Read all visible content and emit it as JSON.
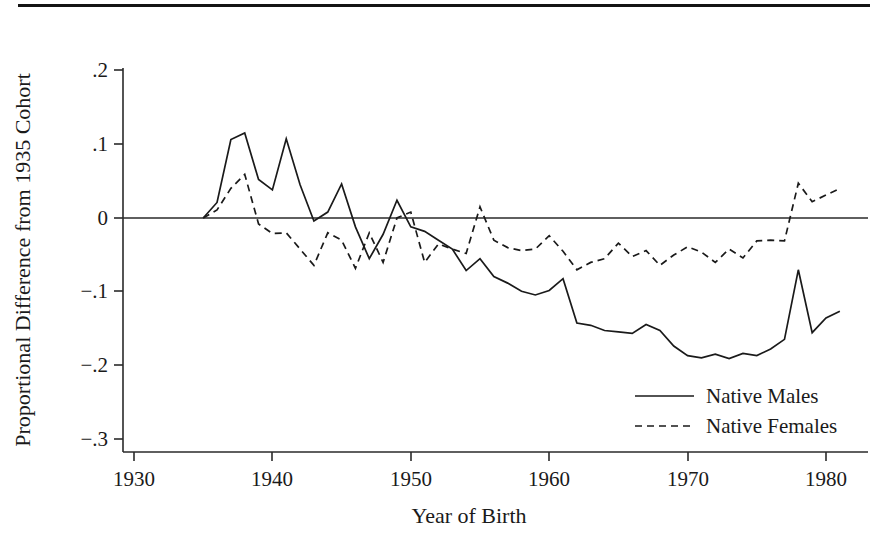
{
  "figure": {
    "has_top_rule": true,
    "background": "#ffffff",
    "ink_color": "#1a1a1a"
  },
  "chart_data": {
    "type": "line",
    "title": "",
    "subtitle": "",
    "xlabel": "Year of Birth",
    "ylabel": "Proportional Difference from 1935 Cohort",
    "xlim": [
      1930,
      1982
    ],
    "ylim": [
      -0.3,
      0.2
    ],
    "xticks": [
      1930,
      1940,
      1950,
      1960,
      1970,
      1980
    ],
    "xtick_labels": [
      "1930",
      "1940",
      "1950",
      "1960",
      "1970",
      "1980"
    ],
    "yticks": [
      0.2,
      0.1,
      0,
      -0.1,
      -0.2,
      -0.3
    ],
    "ytick_labels": [
      ".2",
      ".1",
      "0",
      "−.1",
      "−.2",
      "−.3"
    ],
    "grid": false,
    "zero_line": true,
    "legend_position": "lower-right",
    "x": [
      1935,
      1936,
      1937,
      1938,
      1939,
      1940,
      1941,
      1942,
      1943,
      1944,
      1945,
      1946,
      1947,
      1948,
      1949,
      1950,
      1951,
      1952,
      1953,
      1954,
      1955,
      1956,
      1957,
      1958,
      1959,
      1960,
      1961,
      1962,
      1963,
      1964,
      1965,
      1966,
      1967,
      1968,
      1969,
      1970,
      1971,
      1972,
      1973,
      1974,
      1975,
      1976,
      1977,
      1978,
      1979,
      1980,
      1981
    ],
    "series": [
      {
        "name": "Native Males",
        "style": "solid",
        "values": [
          0.0,
          0.021,
          0.106,
          0.115,
          0.052,
          0.038,
          0.107,
          0.045,
          -0.004,
          0.008,
          0.046,
          -0.012,
          -0.055,
          -0.022,
          0.024,
          -0.012,
          -0.018,
          -0.03,
          -0.042,
          -0.071,
          -0.055,
          -0.079,
          -0.088,
          -0.099,
          -0.104,
          -0.098,
          -0.082,
          -0.142,
          -0.145,
          -0.152,
          -0.154,
          -0.156,
          -0.144,
          -0.152,
          -0.173,
          -0.186,
          -0.189,
          -0.184,
          -0.19,
          -0.183,
          -0.186,
          -0.177,
          -0.164,
          -0.07,
          -0.155,
          -0.135,
          -0.126
        ]
      },
      {
        "name": "Native Females",
        "style": "dashed",
        "values": [
          0.0,
          0.011,
          0.04,
          0.059,
          -0.008,
          -0.021,
          -0.02,
          -0.042,
          -0.064,
          -0.02,
          -0.03,
          -0.068,
          -0.02,
          -0.06,
          0.0,
          0.008,
          -0.06,
          -0.035,
          -0.042,
          -0.048,
          0.015,
          -0.03,
          -0.04,
          -0.044,
          -0.042,
          -0.024,
          -0.045,
          -0.07,
          -0.06,
          -0.055,
          -0.034,
          -0.052,
          -0.044,
          -0.064,
          -0.05,
          -0.039,
          -0.046,
          -0.06,
          -0.042,
          -0.054,
          -0.031,
          -0.03,
          -0.031,
          0.047,
          0.022,
          0.031,
          0.04
        ]
      }
    ]
  },
  "legend": {
    "items": [
      {
        "label": "Native Males",
        "style": "solid"
      },
      {
        "label": "Native Females",
        "style": "dashed"
      }
    ]
  }
}
